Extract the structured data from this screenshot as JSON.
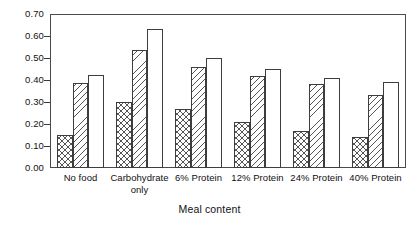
{
  "chart_data": {
    "type": "bar",
    "title": "",
    "subtitle": "",
    "xlabel": "Meal content",
    "ylabel": "",
    "categories": [
      "No food",
      "Carbohydrate only",
      "6% Protein",
      "12% Protein",
      "24% Protein",
      "40% Protein"
    ],
    "category_lines": [
      [
        "No food",
        ""
      ],
      [
        "Carbohydrate",
        "only"
      ],
      [
        "6% Protein",
        ""
      ],
      [
        "12% Protein",
        ""
      ],
      [
        "24% Protein",
        ""
      ],
      [
        "40% Protein",
        ""
      ]
    ],
    "series": [
      {
        "name": "series-1",
        "pattern": "cross-hatch",
        "values": [
          0.15,
          0.3,
          0.27,
          0.21,
          0.17,
          0.14
        ]
      },
      {
        "name": "series-2",
        "pattern": "diagonal-hatch",
        "values": [
          0.385,
          0.535,
          0.46,
          0.42,
          0.38,
          0.33
        ]
      },
      {
        "name": "series-3",
        "pattern": "blank",
        "values": [
          0.425,
          0.63,
          0.5,
          0.45,
          0.41,
          0.39
        ]
      }
    ],
    "ylim": [
      0.0,
      0.7
    ],
    "ytick_values": [
      0.0,
      0.1,
      0.2,
      0.3,
      0.4,
      0.5,
      0.6,
      0.7
    ],
    "ytick_labels": [
      "0.00",
      "0.10",
      "0.20",
      "0.30",
      "0.40",
      "0.50",
      "0.60",
      "0.70"
    ],
    "grid": false,
    "legend": "none",
    "frame": "box"
  },
  "colors": {
    "axis": "#4a4a4a",
    "text": "#111111",
    "hatch": "#555555",
    "background": "#ffffff"
  }
}
